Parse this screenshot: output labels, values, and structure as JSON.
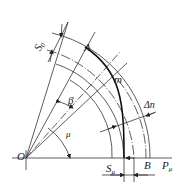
{
  "diagram": {
    "title": "",
    "type": "geometric construction",
    "labels": {
      "A": "A",
      "m": "m",
      "O": "O",
      "B": "B",
      "beta": "β",
      "mu": "μ",
      "delta_n": "Δn",
      "S0_main": "S",
      "S0_sub": "0",
      "Smu_main": "S",
      "Smu_sub": "μ",
      "P_main": "P",
      "P_sub": "μ"
    },
    "colors": {
      "line": "#333333",
      "heavy_curve": "#111111",
      "background": "#ffffff"
    }
  }
}
